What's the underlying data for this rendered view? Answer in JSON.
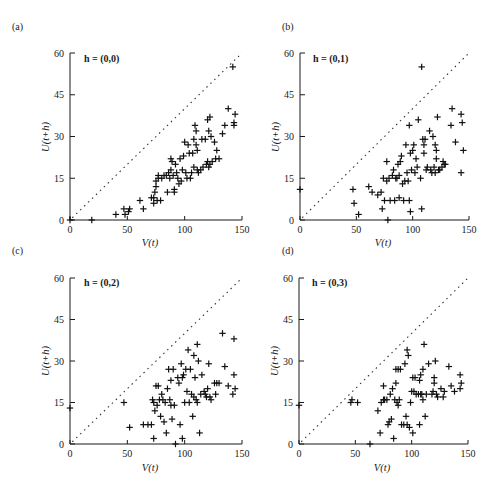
{
  "figure": {
    "x_axis_label": "V(t)",
    "y_axis_label": "U(t+h)",
    "x_ticks": [
      0,
      50,
      100,
      150
    ],
    "y_ticks": [
      0,
      15,
      30,
      45,
      60
    ],
    "xlim": [
      0,
      150
    ],
    "ylim": [
      0,
      60
    ],
    "reference_line": "y = 0.4x (dotted diagonal)",
    "marker": "+"
  },
  "chart_data": [
    {
      "type": "scatter",
      "panel": "(a)",
      "title": "h = (0,0)",
      "xlabel": "V(t)",
      "ylabel": "U(t+h)",
      "xlim": [
        0,
        150
      ],
      "ylim": [
        0,
        60
      ],
      "x_ticks": [
        0,
        50,
        100,
        150
      ],
      "y_ticks": [
        0,
        15,
        30,
        45,
        60
      ],
      "grid": false,
      "points": [
        [
          0,
          0
        ],
        [
          19,
          0
        ],
        [
          40,
          2
        ],
        [
          47,
          4
        ],
        [
          48,
          2
        ],
        [
          52,
          4
        ],
        [
          51,
          3
        ],
        [
          61,
          7
        ],
        [
          64,
          4
        ],
        [
          71,
          8
        ],
        [
          73,
          6
        ],
        [
          73,
          8
        ],
        [
          74,
          10
        ],
        [
          75,
          14
        ],
        [
          75,
          12
        ],
        [
          77,
          15
        ],
        [
          77,
          16
        ],
        [
          79,
          7
        ],
        [
          76,
          7
        ],
        [
          80,
          15
        ],
        [
          82,
          16
        ],
        [
          84,
          16
        ],
        [
          85,
          10
        ],
        [
          86,
          17
        ],
        [
          87,
          15
        ],
        [
          88,
          22
        ],
        [
          88,
          18
        ],
        [
          89,
          21
        ],
        [
          90,
          16
        ],
        [
          91,
          11
        ],
        [
          91,
          10
        ],
        [
          92,
          20
        ],
        [
          93,
          17
        ],
        [
          94,
          15
        ],
        [
          95,
          13
        ],
        [
          96,
          22
        ],
        [
          97,
          14
        ],
        [
          98,
          18
        ],
        [
          99,
          23
        ],
        [
          100,
          28
        ],
        [
          101,
          17
        ],
        [
          102,
          15
        ],
        [
          103,
          27
        ],
        [
          104,
          24
        ],
        [
          105,
          15
        ],
        [
          106,
          17
        ],
        [
          107,
          24
        ],
        [
          108,
          19
        ],
        [
          108,
          29
        ],
        [
          109,
          34
        ],
        [
          110,
          32
        ],
        [
          110,
          27
        ],
        [
          111,
          25
        ],
        [
          111,
          18
        ],
        [
          112,
          17
        ],
        [
          114,
          18
        ],
        [
          115,
          29
        ],
        [
          116,
          19
        ],
        [
          118,
          29
        ],
        [
          119,
          20
        ],
        [
          120,
          36
        ],
        [
          120,
          21
        ],
        [
          121,
          32
        ],
        [
          121,
          19
        ],
        [
          122,
          37
        ],
        [
          122,
          20
        ],
        [
          123,
          30
        ],
        [
          124,
          21
        ],
        [
          126,
          28
        ],
        [
          127,
          22
        ],
        [
          128,
          25
        ],
        [
          130,
          22
        ],
        [
          133,
          31
        ],
        [
          135,
          34
        ],
        [
          138,
          40
        ],
        [
          142,
          55
        ],
        [
          143,
          35
        ],
        [
          143,
          34
        ],
        [
          144,
          38
        ]
      ]
    },
    {
      "type": "scatter",
      "panel": "(b)",
      "title": "h = (0,1)",
      "xlabel": "V(t)",
      "ylabel": "U(t+h)",
      "xlim": [
        0,
        150
      ],
      "ylim": [
        0,
        60
      ],
      "x_ticks": [
        0,
        50,
        100,
        150
      ],
      "y_ticks": [
        0,
        15,
        30,
        45,
        60
      ],
      "grid": false,
      "points": [
        [
          0,
          11
        ],
        [
          47,
          11
        ],
        [
          48,
          6
        ],
        [
          52,
          2
        ],
        [
          61,
          12
        ],
        [
          64,
          10
        ],
        [
          69,
          9
        ],
        [
          72,
          10
        ],
        [
          73,
          4
        ],
        [
          74,
          15
        ],
        [
          75,
          7
        ],
        [
          77,
          14
        ],
        [
          77,
          21
        ],
        [
          78,
          0
        ],
        [
          79,
          15
        ],
        [
          80,
          7
        ],
        [
          82,
          16
        ],
        [
          83,
          18
        ],
        [
          84,
          7
        ],
        [
          85,
          15
        ],
        [
          86,
          15
        ],
        [
          87,
          20
        ],
        [
          88,
          8
        ],
        [
          88,
          16
        ],
        [
          89,
          21
        ],
        [
          90,
          23
        ],
        [
          91,
          13
        ],
        [
          92,
          7
        ],
        [
          93,
          14
        ],
        [
          94,
          27
        ],
        [
          95,
          17
        ],
        [
          96,
          14
        ],
        [
          97,
          7
        ],
        [
          97,
          34
        ],
        [
          98,
          3
        ],
        [
          98,
          24
        ],
        [
          99,
          18
        ],
        [
          100,
          25
        ],
        [
          101,
          27
        ],
        [
          102,
          17
        ],
        [
          103,
          22
        ],
        [
          104,
          19
        ],
        [
          105,
          36
        ],
        [
          107,
          15
        ],
        [
          108,
          4
        ],
        [
          108,
          55
        ],
        [
          109,
          29
        ],
        [
          110,
          24
        ],
        [
          110,
          27
        ],
        [
          111,
          29
        ],
        [
          112,
          18
        ],
        [
          113,
          19
        ],
        [
          115,
          32
        ],
        [
          116,
          18
        ],
        [
          117,
          17
        ],
        [
          118,
          30
        ],
        [
          119,
          19
        ],
        [
          120,
          17
        ],
        [
          120,
          27
        ],
        [
          121,
          22
        ],
        [
          121,
          25
        ],
        [
          122,
          37
        ],
        [
          123,
          18
        ],
        [
          124,
          18
        ],
        [
          126,
          19
        ],
        [
          127,
          21
        ],
        [
          128,
          20
        ],
        [
          129,
          20
        ],
        [
          134,
          34
        ],
        [
          135,
          40
        ],
        [
          138,
          28
        ],
        [
          143,
          17
        ],
        [
          143,
          38
        ],
        [
          144,
          35
        ],
        [
          145,
          25
        ]
      ]
    },
    {
      "type": "scatter",
      "panel": "(c)",
      "title": "h = (0,2)",
      "xlabel": "V(t)",
      "ylabel": "U(t+h)",
      "xlim": [
        0,
        150
      ],
      "ylim": [
        0,
        60
      ],
      "x_ticks": [
        0,
        50,
        100,
        150
      ],
      "y_ticks": [
        0,
        15,
        30,
        45,
        60
      ],
      "grid": false,
      "points": [
        [
          0,
          13
        ],
        [
          47,
          15
        ],
        [
          52,
          6
        ],
        [
          64,
          7
        ],
        [
          68,
          7
        ],
        [
          71,
          7
        ],
        [
          72,
          16
        ],
        [
          73,
          2
        ],
        [
          73,
          15
        ],
        [
          74,
          12
        ],
        [
          75,
          21
        ],
        [
          76,
          14
        ],
        [
          77,
          21
        ],
        [
          78,
          16
        ],
        [
          79,
          10
        ],
        [
          80,
          18
        ],
        [
          81,
          16
        ],
        [
          82,
          8
        ],
        [
          83,
          15
        ],
        [
          84,
          4
        ],
        [
          85,
          20
        ],
        [
          86,
          27
        ],
        [
          87,
          16
        ],
        [
          88,
          14
        ],
        [
          88,
          23
        ],
        [
          89,
          9
        ],
        [
          90,
          27
        ],
        [
          91,
          14
        ],
        [
          92,
          0
        ],
        [
          94,
          24
        ],
        [
          95,
          22
        ],
        [
          96,
          7
        ],
        [
          97,
          29
        ],
        [
          98,
          2
        ],
        [
          98,
          24
        ],
        [
          99,
          25
        ],
        [
          100,
          15
        ],
        [
          101,
          27
        ],
        [
          102,
          19
        ],
        [
          103,
          34
        ],
        [
          104,
          15
        ],
        [
          105,
          27
        ],
        [
          106,
          18
        ],
        [
          107,
          10
        ],
        [
          108,
          17
        ],
        [
          108,
          32
        ],
        [
          109,
          24
        ],
        [
          110,
          16
        ],
        [
          111,
          36
        ],
        [
          111,
          15
        ],
        [
          112,
          30
        ],
        [
          113,
          4
        ],
        [
          114,
          18
        ],
        [
          115,
          25
        ],
        [
          117,
          19
        ],
        [
          118,
          18
        ],
        [
          119,
          17
        ],
        [
          120,
          20
        ],
        [
          121,
          29
        ],
        [
          122,
          17
        ],
        [
          123,
          16
        ],
        [
          126,
          22
        ],
        [
          127,
          18
        ],
        [
          128,
          22
        ],
        [
          130,
          22
        ],
        [
          133,
          40
        ],
        [
          135,
          28
        ],
        [
          138,
          21
        ],
        [
          142,
          18
        ],
        [
          143,
          38
        ],
        [
          143,
          25
        ],
        [
          144,
          20
        ]
      ]
    },
    {
      "type": "scatter",
      "panel": "(d)",
      "title": "h = (0,3)",
      "xlabel": "V(t)",
      "ylabel": "U(t+h)",
      "xlim": [
        0,
        150
      ],
      "ylim": [
        0,
        60
      ],
      "x_ticks": [
        0,
        50,
        100,
        150
      ],
      "y_ticks": [
        0,
        15,
        30,
        45,
        60
      ],
      "grid": false,
      "points": [
        [
          0,
          14
        ],
        [
          46,
          15
        ],
        [
          47,
          16
        ],
        [
          52,
          15
        ],
        [
          63,
          0
        ],
        [
          70,
          12
        ],
        [
          72,
          4
        ],
        [
          73,
          15
        ],
        [
          75,
          16
        ],
        [
          75,
          21
        ],
        [
          76,
          16
        ],
        [
          78,
          16
        ],
        [
          79,
          7
        ],
        [
          80,
          8
        ],
        [
          81,
          18
        ],
        [
          82,
          9
        ],
        [
          83,
          20
        ],
        [
          84,
          2
        ],
        [
          85,
          16
        ],
        [
          86,
          27
        ],
        [
          86,
          22
        ],
        [
          87,
          15
        ],
        [
          88,
          14
        ],
        [
          88,
          27
        ],
        [
          89,
          16
        ],
        [
          90,
          27
        ],
        [
          91,
          7
        ],
        [
          93,
          7
        ],
        [
          94,
          29
        ],
        [
          95,
          10
        ],
        [
          96,
          7
        ],
        [
          96,
          34
        ],
        [
          97,
          32
        ],
        [
          98,
          6
        ],
        [
          99,
          15
        ],
        [
          100,
          19
        ],
        [
          101,
          4
        ],
        [
          101,
          24
        ],
        [
          102,
          19
        ],
        [
          103,
          24
        ],
        [
          104,
          18
        ],
        [
          106,
          18
        ],
        [
          107,
          7
        ],
        [
          107,
          23
        ],
        [
          108,
          18
        ],
        [
          108,
          25
        ],
        [
          109,
          18
        ],
        [
          110,
          16
        ],
        [
          110,
          27
        ],
        [
          111,
          36
        ],
        [
          112,
          10
        ],
        [
          113,
          18
        ],
        [
          115,
          29
        ],
        [
          118,
          18
        ],
        [
          119,
          19
        ],
        [
          120,
          22
        ],
        [
          120,
          24
        ],
        [
          121,
          30
        ],
        [
          122,
          18
        ],
        [
          123,
          17
        ],
        [
          126,
          20
        ],
        [
          128,
          17
        ],
        [
          129,
          19
        ],
        [
          133,
          28
        ],
        [
          135,
          21
        ],
        [
          138,
          19
        ],
        [
          143,
          20
        ],
        [
          143,
          25
        ],
        [
          144,
          22
        ]
      ]
    }
  ],
  "panels": [
    {
      "label": "(a)",
      "title": "h = (0,0)"
    },
    {
      "label": "(b)",
      "title": "h = (0,1)"
    },
    {
      "label": "(c)",
      "title": "h = (0,2)"
    },
    {
      "label": "(d)",
      "title": "h = (0,3)"
    }
  ]
}
